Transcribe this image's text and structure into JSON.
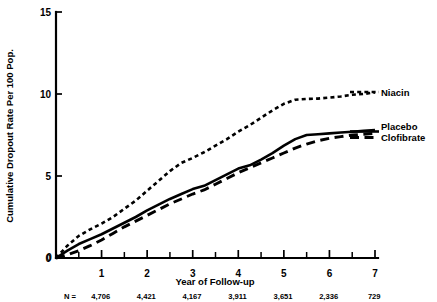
{
  "chart_data": {
    "type": "line",
    "title": "",
    "xlabel": "Year of Follow-up",
    "ylabel": "Cumulative Dropout Rate Per 100 Pop.",
    "xlim": [
      0,
      7
    ],
    "ylim": [
      0,
      15
    ],
    "grid": false,
    "legend_position": "right",
    "x_ticks_major": [
      0,
      1,
      2,
      3,
      4,
      5,
      6,
      7
    ],
    "x_tick_labels": [
      "0",
      "1",
      "2",
      "3",
      "4",
      "5",
      "6",
      "7"
    ],
    "x_ticks_minor": [
      0.5,
      1.5,
      2.5,
      3.5,
      4.5,
      5.5,
      6.5
    ],
    "y_ticks_major": [
      0,
      5,
      10,
      15
    ],
    "y_tick_labels": [
      "0",
      "5",
      "10",
      "15"
    ],
    "series": [
      {
        "name": "Niacin",
        "style": "dotted",
        "x": [
          0,
          0.25,
          0.5,
          0.75,
          1.0,
          1.25,
          1.5,
          1.75,
          2.0,
          2.25,
          2.5,
          2.75,
          3.0,
          3.25,
          3.5,
          3.75,
          4.0,
          4.25,
          4.5,
          4.75,
          5.0,
          5.25,
          5.5,
          5.75,
          6.0,
          6.25,
          6.5,
          6.75,
          7.0
        ],
        "y": [
          0,
          0.75,
          1.35,
          1.75,
          2.1,
          2.5,
          3.0,
          3.5,
          4.1,
          4.7,
          5.3,
          5.8,
          6.1,
          6.45,
          6.85,
          7.25,
          7.7,
          8.1,
          8.55,
          9.0,
          9.4,
          9.65,
          9.7,
          9.72,
          9.78,
          9.85,
          9.95,
          10.0,
          10.1
        ]
      },
      {
        "name": "Placebo",
        "style": "solid",
        "x": [
          0,
          0.25,
          0.5,
          0.75,
          1.0,
          1.25,
          1.5,
          1.75,
          2.0,
          2.25,
          2.5,
          2.75,
          3.0,
          3.25,
          3.5,
          3.75,
          4.0,
          4.25,
          4.5,
          4.75,
          5.0,
          5.25,
          5.5,
          5.75,
          6.0,
          6.25,
          6.5,
          6.75,
          7.0
        ],
        "y": [
          0,
          0.45,
          0.85,
          1.15,
          1.45,
          1.8,
          2.15,
          2.5,
          2.9,
          3.25,
          3.6,
          3.9,
          4.2,
          4.4,
          4.75,
          5.1,
          5.45,
          5.65,
          6.0,
          6.4,
          6.85,
          7.25,
          7.5,
          7.55,
          7.6,
          7.65,
          7.7,
          7.75,
          7.8
        ]
      },
      {
        "name": "Clofibrate",
        "style": "dashed",
        "x": [
          0,
          0.25,
          0.5,
          0.75,
          1.0,
          1.25,
          1.5,
          1.75,
          2.0,
          2.25,
          2.5,
          2.75,
          3.0,
          3.25,
          3.5,
          3.75,
          4.0,
          4.25,
          4.5,
          4.75,
          5.0,
          5.25,
          5.5,
          5.75,
          6.0,
          6.25,
          6.5,
          6.75,
          7.0
        ],
        "y": [
          0,
          0.2,
          0.45,
          0.75,
          1.1,
          1.5,
          1.9,
          2.25,
          2.6,
          2.95,
          3.3,
          3.6,
          3.9,
          4.15,
          4.5,
          4.85,
          5.2,
          5.5,
          5.8,
          6.1,
          6.4,
          6.7,
          6.95,
          7.15,
          7.3,
          7.4,
          7.5,
          7.55,
          7.6
        ]
      }
    ],
    "annotations": {
      "n_row_prefix": "N =",
      "n_values": [
        "4,706",
        "4,421",
        "4,167",
        "3,911",
        "3,651",
        "2,336",
        "729"
      ]
    }
  },
  "legend": {
    "items": [
      {
        "label": "Niacin"
      },
      {
        "label": "Placebo"
      },
      {
        "label": "Clofibrate"
      }
    ]
  }
}
